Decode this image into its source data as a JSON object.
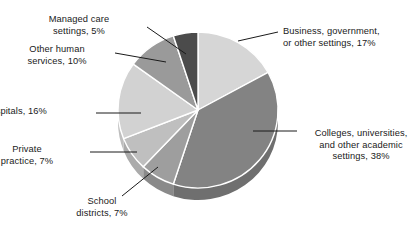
{
  "chart_data": {
    "type": "pie",
    "title": "",
    "subtitle": "",
    "xlabel": "",
    "ylabel": "",
    "legend_position": "none",
    "grid": false,
    "style": "3d-pie",
    "unit": "%",
    "total": 100,
    "start_angle_deg": 0,
    "direction": "clockwise",
    "categories": [
      "Business, government, or other settings",
      "Colleges, universities, and other academic settings",
      "School districts",
      "Private practice",
      "Hospitals",
      "Other human services",
      "Managed care settings"
    ],
    "values": [
      17,
      38,
      7,
      7,
      16,
      10,
      5
    ],
    "slices": [
      {
        "key": "business",
        "label": "Business, government,\nor other settings, 17%",
        "name": "Business, government, or other settings",
        "value": 17,
        "color": "#d6d6d6",
        "side_color": "#c2c2c2"
      },
      {
        "key": "colleges",
        "label": "Colleges, universities,\nand other academic\nsettings, 38%",
        "name": "Colleges, universities, and other academic settings",
        "value": 38,
        "color": "#838383",
        "side_color": "#6f6f6f"
      },
      {
        "key": "school-districts",
        "label": "School\ndistricts, 7%",
        "name": "School districts",
        "value": 7,
        "color": "#9e9e9e",
        "side_color": "#8a8a8a"
      },
      {
        "key": "private-practice",
        "label": "Private\npractice, 7%",
        "name": "Private practice",
        "value": 7,
        "color": "#bfbfbf",
        "side_color": "#ababab"
      },
      {
        "key": "hospitals",
        "label": "Hospitals, 16%",
        "name": "Hospitals",
        "value": 16,
        "color": "#d2d2d2",
        "side_color": "#bebebe"
      },
      {
        "key": "other-human-services",
        "label": "Other human\nservices, 10%",
        "name": "Other human services",
        "value": 10,
        "color": "#9a9a9a",
        "side_color": "#868686"
      },
      {
        "key": "managed-care",
        "label": "Managed care\nsettings, 5%",
        "name": "Managed care settings",
        "value": 5,
        "color": "#4b4b4b",
        "side_color": "#3a3a3a"
      }
    ],
    "colors": {
      "background": "#ffffff",
      "text": "#1a1a1a",
      "leader_line": "#1a1a1a",
      "slice_edge": "#ffffff"
    }
  }
}
